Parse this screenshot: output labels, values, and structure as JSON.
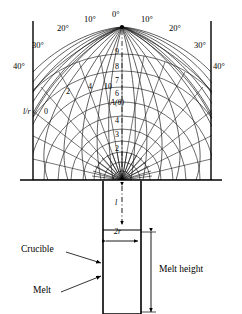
{
  "figure": {
    "type": "polar-isoline-diagram-with-crucible",
    "background": "#ffffff",
    "line_color": "#000000",
    "grid_color": "#2b2b2b"
  },
  "polar_field": {
    "origin": {
      "x": 122,
      "y": 180
    },
    "baseline_y": 180,
    "frame": {
      "left": 33,
      "right": 212,
      "top": 21,
      "bottom": 180
    },
    "angle_unit": "°",
    "angle_labels_left": [
      "10°",
      "20°",
      "30°",
      "40°"
    ],
    "angle_labels_right": [
      "10°",
      "20°",
      "30°",
      "40°"
    ],
    "angle_label_center": "0°",
    "ratio_label": "l/r",
    "ratio_zero_label": "0",
    "isoline_labels": [
      "2",
      "4",
      "10"
    ],
    "axis_numbers": [
      "9",
      "8",
      "7",
      "6",
      "4",
      "3",
      "2"
    ],
    "function_label": "A(θ)",
    "radii": [
      9,
      18,
      28,
      39,
      51,
      64,
      78,
      93,
      109,
      126
    ],
    "ray_angles_deg": [
      -90,
      -80,
      -70,
      -60,
      -50,
      -40,
      -30,
      -20,
      -10,
      0,
      10,
      20,
      30,
      40,
      50,
      60,
      70,
      80,
      90
    ]
  },
  "crucible": {
    "neck_label": "l",
    "diameter_label": "2r",
    "crucible_label": "Crucible",
    "melt_label": "Melt",
    "melt_height_label": "Melt height",
    "neck": {
      "x": 103,
      "y": 181,
      "w": 38,
      "h": 49
    },
    "body": {
      "x": 103,
      "y": 230,
      "w": 38,
      "h": 84
    }
  }
}
